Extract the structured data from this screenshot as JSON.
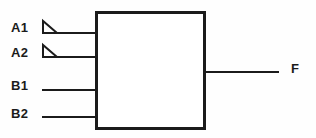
{
  "diagram": {
    "kind": "logic-block-diagram",
    "title": "",
    "background_color": "#fefefe",
    "line_color": "#1b1b1b",
    "body": {
      "name": "gate-body",
      "shape": "rectangle",
      "x": 95,
      "y": 11,
      "width": 110,
      "height": 119,
      "stroke_width": 3,
      "fill": "#ffffff",
      "label": ""
    },
    "inputs": [
      {
        "id": "A1",
        "label": "A1",
        "y": 33,
        "line_start_x": 42,
        "line_end_x": 96,
        "marker": "triangle",
        "marker_x": 42,
        "marker_y": 21,
        "marker_width": 15,
        "marker_height": 12
      },
      {
        "id": "A2",
        "label": "A2",
        "y": 57,
        "line_start_x": 42,
        "line_end_x": 96,
        "marker": "triangle",
        "marker_x": 42,
        "marker_y": 45,
        "marker_width": 15,
        "marker_height": 12
      },
      {
        "id": "B1",
        "label": "B1",
        "y": 90,
        "line_start_x": 42,
        "line_end_x": 96,
        "marker": "none"
      },
      {
        "id": "B2",
        "label": "B2",
        "y": 117,
        "line_start_x": 42,
        "line_end_x": 96,
        "marker": "none"
      }
    ],
    "outputs": [
      {
        "id": "F",
        "label": "F",
        "y": 72,
        "line_start_x": 204,
        "line_end_x": 279
      }
    ]
  }
}
